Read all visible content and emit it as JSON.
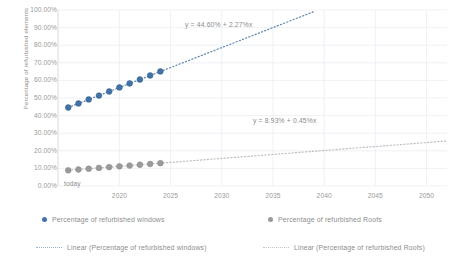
{
  "chart_data": {
    "type": "scatter",
    "title": "",
    "xlabel": "",
    "ylabel": "Percentage of refurbished elements",
    "xlim": [
      2014,
      2052
    ],
    "ylim": [
      0,
      1
    ],
    "grid": true,
    "legend_position": "bottom",
    "x_tick_labels": [
      "2020",
      "2025",
      "2030",
      "2035",
      "2040",
      "2045",
      "2050"
    ],
    "x_tick_values": [
      2020,
      2025,
      2030,
      2035,
      2040,
      2045,
      2050
    ],
    "origin_label": "today",
    "y_tick_labels": [
      "100.00%",
      "90.00%",
      "80.00%",
      "70.00%",
      "60.00%",
      "50.00%",
      "40.00%",
      "30.00%",
      "20.00%",
      "10.00%",
      "0.00%"
    ],
    "y_tick_values": [
      1.0,
      0.9,
      0.8,
      0.7,
      0.6,
      0.5,
      0.4,
      0.3,
      0.2,
      0.1,
      0.0
    ],
    "series": [
      {
        "name": "Percentage of refurbished windows",
        "color": "#4472a4",
        "marker": "circle",
        "x": [
          2015,
          2016,
          2017,
          2018,
          2019,
          2020,
          2021,
          2022,
          2023,
          2024
        ],
        "values": [
          0.446,
          0.469,
          0.492,
          0.514,
          0.537,
          0.56,
          0.583,
          0.605,
          0.628,
          0.651
        ]
      },
      {
        "name": "Percentage of refurbished Roofs",
        "color": "#9a9a9a",
        "marker": "circle",
        "x": [
          2015,
          2016,
          2017,
          2018,
          2019,
          2020,
          2021,
          2022,
          2023,
          2024
        ],
        "values": [
          0.0893,
          0.0938,
          0.0983,
          0.1028,
          0.1073,
          0.1118,
          0.1163,
          0.1208,
          0.1253,
          0.1298
        ]
      }
    ],
    "trendlines": [
      {
        "name": "Linear (Percentage of refurbished windows)",
        "color": "#4472a4",
        "style": "dotted",
        "intercept": 0.446,
        "slope": 0.0227,
        "equation": "y = 44.60% + 2.27%x",
        "x_start": 2015,
        "x_end": 2039
      },
      {
        "name": "Linear (Percentage of refurbished Roofs)",
        "color": "#b5b5b5",
        "style": "dotted",
        "intercept": 0.0893,
        "slope": 0.0045,
        "equation": "y = 8.93% + 0.45%x",
        "x_start": 2015,
        "x_end": 2052
      }
    ],
    "annotations": [
      {
        "text": "y = 44.60% + 2.27%x",
        "x_px": 185,
        "y_px": 21
      },
      {
        "text": "y = 8.93% + 0.45%x",
        "x_px": 253,
        "y_px": 117
      }
    ]
  },
  "legend": {
    "rows": [
      [
        {
          "label": "Percentage of refurbished windows",
          "marker": "dot",
          "color": "#4472a4",
          "x_px": 42
        },
        {
          "label": "Percentage of refurbished Roofs",
          "marker": "dot",
          "color": "#9a9a9a",
          "x_px": 268
        }
      ],
      [
        {
          "label": "Linear (Percentage of refurbished windows)",
          "marker": "dotted-line",
          "color": "#9ab0cf",
          "x_px": 36
        },
        {
          "label": "Linear (Percentage of refurbished Roofs)",
          "marker": "dotted-line",
          "color": "#c3c3c3",
          "x_px": 263
        }
      ]
    ]
  },
  "axis": {
    "y_title": "Percentage of refurbished elements",
    "origin_label": "today"
  }
}
